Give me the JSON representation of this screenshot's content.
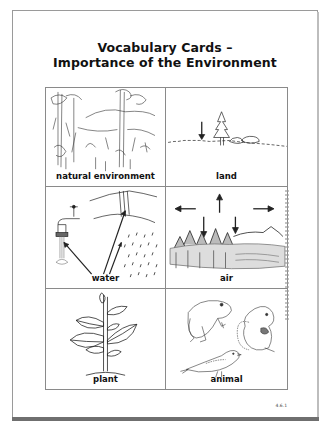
{
  "document": {
    "title_line1": "Vocabulary Cards –",
    "title_line2": "Importance of the Environment",
    "page_number": "4.6.1"
  },
  "cards": [
    {
      "label": "natural environment",
      "icon": "forest-scene-icon"
    },
    {
      "label": "land",
      "icon": "land-horizon-icon"
    },
    {
      "label": "water",
      "icon": "water-faucet-waterfall-rain-icon"
    },
    {
      "label": "air",
      "icon": "air-arrows-trees-icon"
    },
    {
      "label": "plant",
      "icon": "plant-icon"
    },
    {
      "label": "animal",
      "icon": "animals-frog-bird-squirrel-icon"
    }
  ],
  "colors": {
    "text": "#111111",
    "border": "#8a8a8a",
    "frame": "#9a9a9a",
    "shadow": "#6f6f6f"
  }
}
